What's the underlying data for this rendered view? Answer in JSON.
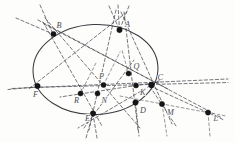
{
  "figure": {
    "type": "geometry-diagram",
    "canvas": {
      "width": 235,
      "height": 142
    },
    "colors": {
      "background": "#fdfdfc",
      "conic_stroke": "#3a3a40",
      "dashed_line": "#4a4a52",
      "dashed_line_faint": "#6a6a72",
      "point_fill": "#151519",
      "label_fill": "#4b4b52"
    },
    "conic": {
      "name": "ellipse",
      "cx": 95.5,
      "cy": 69.5,
      "rx": 62.5,
      "ry": 45.0,
      "rotation": -2.5,
      "stroke_width": 1.05
    },
    "points": [
      {
        "id": "B",
        "label": "B",
        "x": 53.5,
        "y": 34.0,
        "lx": 56.5,
        "ly": 27.5,
        "r": 2.6,
        "on_conic": true
      },
      {
        "id": "A",
        "label": "A",
        "x": 119.5,
        "y": 30.0,
        "lx": 125.0,
        "ly": 27.0,
        "r": 2.7,
        "on_conic": true
      },
      {
        "id": "C",
        "label": "C",
        "x": 151.5,
        "y": 85.0,
        "lx": 157.5,
        "ly": 80.0,
        "r": 2.9,
        "on_conic": true
      },
      {
        "id": "D",
        "label": "D",
        "x": 135.5,
        "y": 102.5,
        "lx": 140.0,
        "ly": 112.5,
        "r": 2.7,
        "on_conic": true
      },
      {
        "id": "E",
        "label": "E",
        "x": 93.0,
        "y": 113.5,
        "lx": 85.0,
        "ly": 121.0,
        "r": 2.7,
        "on_conic": true
      },
      {
        "id": "F",
        "label": "F",
        "x": 37.5,
        "y": 86.0,
        "lx": 33.0,
        "ly": 96.5,
        "r": 2.7,
        "on_conic": true
      },
      {
        "id": "P",
        "label": "P",
        "x": 103.5,
        "y": 85.0,
        "lx": 99.0,
        "ly": 79.0,
        "r": 2.5,
        "on_conic": false
      },
      {
        "id": "Q",
        "label": "Q",
        "x": 128.5,
        "y": 73.5,
        "lx": 133.5,
        "ly": 69.0,
        "r": 2.5,
        "on_conic": false
      },
      {
        "id": "K",
        "label": "K",
        "x": 136.0,
        "y": 85.5,
        "lx": 140.0,
        "ly": 94.5,
        "r": 2.5,
        "on_conic": false
      },
      {
        "id": "R",
        "label": "R",
        "x": 80.5,
        "y": 93.5,
        "lx": 74.0,
        "ly": 102.5,
        "r": 2.5,
        "on_conic": false
      },
      {
        "id": "N",
        "label": "N",
        "x": 97.5,
        "y": 93.5,
        "lx": 101.5,
        "ly": 103.0,
        "r": 2.5,
        "on_conic": false
      },
      {
        "id": "M",
        "label": "M",
        "x": 162.0,
        "y": 104.0,
        "lx": 167.0,
        "ly": 114.5,
        "r": 2.6,
        "on_conic": false
      },
      {
        "id": "L",
        "label": "L",
        "x": 208.0,
        "y": 112.5,
        "lx": 213.5,
        "ly": 120.5,
        "r": 2.6,
        "on_conic": false
      }
    ],
    "lines": [
      {
        "id": "pascal-axis",
        "from": [
          12,
          88.5
        ],
        "to": [
          228,
          79.0
        ],
        "style": "dash"
      },
      {
        "id": "FC-chord",
        "from": [
          30,
          87.5
        ],
        "to": [
          228,
          82.5
        ],
        "style": "dash"
      },
      {
        "id": "B-to-L",
        "from": [
          38,
          20.0
        ],
        "to": [
          222,
          118.0
        ],
        "style": "dash"
      },
      {
        "id": "A-to-F",
        "from": [
          127,
          12.0
        ],
        "to": [
          28,
          89.5
        ],
        "style": "dash"
      },
      {
        "id": "A-to-E",
        "from": [
          116,
          10.0
        ],
        "to": [
          89,
          130.0
        ],
        "style": "dash"
      },
      {
        "id": "A-to-M",
        "from": [
          121,
          12.0
        ],
        "to": [
          172,
          124.0
        ],
        "style": "dash"
      },
      {
        "id": "A-to-D",
        "from": [
          124,
          12.0
        ],
        "to": [
          138,
          130.0
        ],
        "style": "dash"
      },
      {
        "id": "B-to-D",
        "from": [
          45,
          18.0
        ],
        "to": [
          140,
          128.0
        ],
        "style": "dash"
      },
      {
        "id": "B-to-N",
        "from": [
          43,
          22.0
        ],
        "to": [
          102,
          126.0
        ],
        "style": "dash"
      },
      {
        "id": "B-to-C",
        "from": [
          44,
          24.0
        ],
        "to": [
          168,
          89.0
        ],
        "style": "dash"
      },
      {
        "id": "C-to-E",
        "from": [
          160,
          80.0
        ],
        "to": [
          78,
          128.0
        ],
        "style": "dash"
      },
      {
        "id": "C-to-R",
        "from": [
          159,
          82.0
        ],
        "to": [
          60,
          97.0
        ],
        "style": "dash"
      },
      {
        "id": "C-to-L",
        "from": [
          150,
          86.0
        ],
        "to": [
          224,
          120.0
        ],
        "style": "dash"
      },
      {
        "id": "C-to-M",
        "from": [
          150,
          86.5
        ],
        "to": [
          176,
          126.0
        ],
        "style": "dash"
      },
      {
        "id": "D-to-L",
        "from": [
          120,
          96.0
        ],
        "to": [
          226,
          116.0
        ],
        "style": "dash-faint"
      },
      {
        "id": "E-to-Q",
        "from": [
          84,
          128.0
        ],
        "to": [
          134,
          60.0
        ],
        "style": "dash"
      },
      {
        "id": "F-far-left",
        "from": [
          8,
          89.5
        ],
        "to": [
          40,
          86.5
        ],
        "style": "dash"
      },
      {
        "id": "B-upleft",
        "from": [
          16,
          18.0
        ],
        "to": [
          53,
          34.0
        ],
        "style": "dash"
      },
      {
        "id": "B-up",
        "from": [
          40,
          5.0
        ],
        "to": [
          53,
          34.0
        ],
        "style": "dash"
      },
      {
        "id": "A-up1",
        "from": [
          109,
          6.0
        ],
        "to": [
          119.5,
          30.0
        ],
        "style": "dash"
      },
      {
        "id": "A-up2",
        "from": [
          118,
          5.0
        ],
        "to": [
          119.5,
          30.0
        ],
        "style": "dash"
      },
      {
        "id": "A-up3",
        "from": [
          129,
          6.0
        ],
        "to": [
          119.5,
          30.0
        ],
        "style": "dash"
      },
      {
        "id": "E-down1",
        "from": [
          93,
          113.5
        ],
        "to": [
          86,
          138.0
        ],
        "style": "dash"
      },
      {
        "id": "E-down2",
        "from": [
          93,
          113.5
        ],
        "to": [
          97,
          138.0
        ],
        "style": "dash"
      },
      {
        "id": "D-down",
        "from": [
          135.5,
          102.5
        ],
        "to": [
          139,
          136.0
        ],
        "style": "dash"
      },
      {
        "id": "M-down",
        "from": [
          162,
          104.0
        ],
        "to": [
          167,
          136.0
        ],
        "style": "dash-faint"
      },
      {
        "id": "L-down",
        "from": [
          208,
          112.5
        ],
        "to": [
          210,
          136.0
        ],
        "style": "dash-faint"
      },
      {
        "id": "Q-up",
        "from": [
          128.5,
          73.5
        ],
        "to": [
          122,
          50.0
        ],
        "style": "dash-faint"
      },
      {
        "id": "P-diag",
        "from": [
          103.5,
          85.0
        ],
        "to": [
          120,
          52.0
        ],
        "style": "dash-faint"
      },
      {
        "id": "R-up",
        "from": [
          80.5,
          93.5
        ],
        "to": [
          96,
          63.0
        ],
        "style": "dash-faint"
      }
    ]
  }
}
